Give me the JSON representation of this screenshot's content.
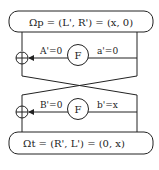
{
  "diagram": {
    "top_box": {
      "label": "Ωp = (L', R') = (x, 0)"
    },
    "bottom_box": {
      "label": "Ωt = (R', L') = (0, x)"
    },
    "round1": {
      "xor_symbol": "⊕",
      "f_label": "F",
      "output_label": "A'=0",
      "input_label": "a'=0"
    },
    "round2": {
      "xor_symbol": "⊕",
      "f_label": "F",
      "output_label": "B'=0",
      "input_label": "b'=x"
    },
    "colors": {
      "stroke": "#222222",
      "background": "#ffffff"
    }
  }
}
